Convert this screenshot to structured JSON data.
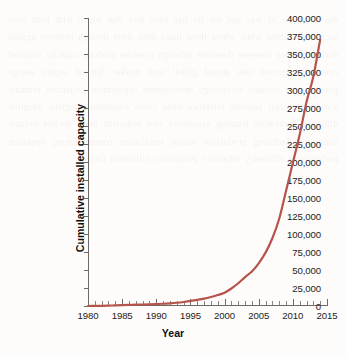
{
  "figure": {
    "background_color": "#fdfcfb",
    "axis_color": "#6e6a66",
    "text_color": "#1d1b19"
  },
  "bleed_text": "the it the on its was and not for has been they that which with from over such under about while where these those their there through between against during because however therefore although consider produce capacity installed cumulative growth rate annual global total market demand supply energy power sector industry technology development deployment projection estimate scenario forecast baseline reference trend curve exponential logistic adoption diffusion innovation learning experience cost reduction price decline volume scale manufacturing production output installation commissioning operation performance efficiency reliability availability utilisation factor",
  "chart_data": {
    "type": "line",
    "title": "",
    "xlabel": "Year",
    "ylabel": "Cumulative installed capacity",
    "xlim": [
      1980,
      2015
    ],
    "ylim": [
      0,
      400000
    ],
    "grid": false,
    "legend": null,
    "line_color": "#b5544b",
    "line_width": 2.2,
    "x_major_tick_step": 5,
    "x_minor_tick_step": 1,
    "y_tick_step": 25000,
    "xticklabels": [
      "1980",
      "1985",
      "1990",
      "1995",
      "2000",
      "2005",
      "2010",
      "2015"
    ],
    "yticklabels": [
      "0",
      "25,000",
      "50,000",
      "75,000",
      "100,000",
      "125,000",
      "150,000",
      "175,000",
      "200,000",
      "225,000",
      "250,000",
      "275,000",
      "300,000",
      "325,000",
      "350,000",
      "375,000",
      "400,000"
    ],
    "yticks": [
      0,
      25000,
      50000,
      75000,
      100000,
      125000,
      150000,
      175000,
      200000,
      225000,
      250000,
      275000,
      300000,
      325000,
      350000,
      375000,
      400000
    ],
    "xticks": [
      1980,
      1985,
      1990,
      1995,
      2000,
      2005,
      2010,
      2015
    ],
    "series": [
      {
        "name": "Cumulative installed capacity",
        "x": [
          1980,
          1981,
          1982,
          1983,
          1984,
          1985,
          1986,
          1987,
          1988,
          1989,
          1990,
          1991,
          1992,
          1993,
          1994,
          1995,
          1996,
          1997,
          1998,
          1999,
          2000,
          2001,
          2002,
          2003,
          2004,
          2005,
          2006,
          2007,
          2008,
          2009,
          2010,
          2011,
          2012,
          2013,
          2014
        ],
        "values": [
          10,
          90,
          200,
          420,
          900,
          1200,
          1500,
          1800,
          2100,
          2400,
          2700,
          3100,
          3700,
          4500,
          5600,
          7000,
          8500,
          10200,
          12500,
          15200,
          18500,
          24300,
          31600,
          40200,
          48000,
          59300,
          74100,
          94100,
          121200,
          159800,
          198800,
          238100,
          283200,
          318700,
          370000
        ]
      }
    ]
  }
}
